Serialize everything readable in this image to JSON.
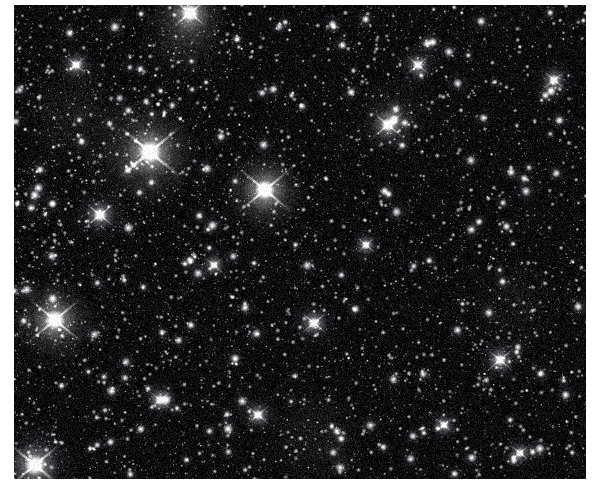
{
  "page": {
    "background_color": "#ffffff",
    "width": 596,
    "height": 492,
    "title": "Dense Galactic Star Field"
  },
  "plate": {
    "name": "star-field-plate",
    "x": 14,
    "y": 5,
    "width": 572,
    "height": 474,
    "background_color": "#07070a",
    "sky_color": "#0a0a0c",
    "star_color": "#ffffff",
    "rendering": "grayscale astronomical exposure",
    "description": "Densely packed grayscale star field with thousands of unresolved point sources and several saturated foreground stars showing diffraction spikes.",
    "noise_opacity": 0.16,
    "grain_scale": 1.0
  },
  "starfield_data": {
    "type": "scatter",
    "seed": 20240517,
    "faint_star_count": 5200,
    "mid_star_count": 1150,
    "bright_star_count": 170,
    "faint_radius_range": [
      0.5,
      1.5
    ],
    "mid_radius_range": [
      1.4,
      2.9
    ],
    "bright_radius_range": [
      2.6,
      5.2
    ],
    "faint_brightness_range": [
      0.25,
      0.62
    ],
    "mid_brightness_range": [
      0.55,
      0.9
    ],
    "bright_brightness_range": [
      0.82,
      1.0
    ],
    "blur_sigma": 0.9,
    "density_gradient": {
      "enabled": true,
      "note": "slightly denser toward left and lower-left of the frame"
    },
    "beacon_stars": [
      {
        "label": "beacon-1",
        "x": 136,
        "y": 147,
        "radius": 15,
        "spike_length": 42,
        "brightness": 1.0
      },
      {
        "label": "beacon-2",
        "x": 251,
        "y": 185,
        "radius": 13,
        "spike_length": 36,
        "brightness": 1.0
      },
      {
        "label": "beacon-3",
        "x": 41,
        "y": 315,
        "radius": 13,
        "spike_length": 34,
        "brightness": 0.98
      },
      {
        "label": "beacon-4",
        "x": 21,
        "y": 460,
        "radius": 14,
        "spike_length": 34,
        "brightness": 0.98
      },
      {
        "label": "beacon-5",
        "x": 176,
        "y": 8,
        "radius": 12,
        "spike_length": 22,
        "brightness": 0.92
      },
      {
        "label": "beacon-6",
        "x": 86,
        "y": 210,
        "radius": 9,
        "spike_length": 20,
        "brightness": 0.9
      },
      {
        "label": "beacon-7",
        "x": 374,
        "y": 120,
        "radius": 9,
        "spike_length": 22,
        "brightness": 0.9
      },
      {
        "label": "beacon-8",
        "x": 300,
        "y": 318,
        "radius": 8,
        "spike_length": 18,
        "brightness": 0.88
      },
      {
        "label": "beacon-9",
        "x": 486,
        "y": 355,
        "radius": 8,
        "spike_length": 18,
        "brightness": 0.88
      },
      {
        "label": "beacon-10",
        "x": 404,
        "y": 60,
        "radius": 7,
        "spike_length": 16,
        "brightness": 0.86
      },
      {
        "label": "beacon-11",
        "x": 244,
        "y": 410,
        "radius": 7,
        "spike_length": 16,
        "brightness": 0.86
      },
      {
        "label": "beacon-12",
        "x": 540,
        "y": 75,
        "radius": 7,
        "spike_length": 15,
        "brightness": 0.85
      },
      {
        "label": "beacon-13",
        "x": 146,
        "y": 395,
        "radius": 7,
        "spike_length": 15,
        "brightness": 0.85
      },
      {
        "label": "beacon-14",
        "x": 352,
        "y": 240,
        "radius": 6,
        "spike_length": 13,
        "brightness": 0.84
      },
      {
        "label": "beacon-15",
        "x": 506,
        "y": 448,
        "radius": 6,
        "spike_length": 13,
        "brightness": 0.84
      },
      {
        "label": "beacon-16",
        "x": 62,
        "y": 60,
        "radius": 7,
        "spike_length": 14,
        "brightness": 0.85
      },
      {
        "label": "beacon-17",
        "x": 430,
        "y": 420,
        "radius": 6,
        "spike_length": 13,
        "brightness": 0.83
      },
      {
        "label": "beacon-18",
        "x": 200,
        "y": 260,
        "radius": 6,
        "spike_length": 12,
        "brightness": 0.83
      }
    ],
    "nebulous_patches": [
      {
        "x": 170,
        "y": 30,
        "radius": 46,
        "brightness": 0.13
      },
      {
        "x": 130,
        "y": 150,
        "radius": 60,
        "brightness": 0.12
      },
      {
        "x": 40,
        "y": 320,
        "radius": 48,
        "brightness": 0.1
      },
      {
        "x": 250,
        "y": 190,
        "radius": 44,
        "brightness": 0.1
      },
      {
        "x": 60,
        "y": 110,
        "radius": 58,
        "brightness": 0.08
      },
      {
        "x": 300,
        "y": 430,
        "radius": 52,
        "brightness": 0.07
      },
      {
        "x": 500,
        "y": 300,
        "radius": 50,
        "brightness": 0.06
      },
      {
        "x": 380,
        "y": 110,
        "radius": 44,
        "brightness": 0.07
      }
    ]
  }
}
